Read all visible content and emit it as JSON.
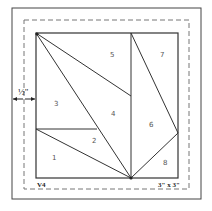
{
  "diagram": {
    "seam_allowance_label": "½\"",
    "block_code": "V4",
    "block_size": "3\" x 3\"",
    "pieces": [
      {
        "label": "1",
        "x": 52,
        "y": 160
      },
      {
        "label": "2",
        "x": 92,
        "y": 143
      },
      {
        "label": "3",
        "x": 54,
        "y": 104
      },
      {
        "label": "4",
        "x": 111,
        "y": 115
      },
      {
        "label": "5",
        "x": 110,
        "y": 55
      },
      {
        "label": "6",
        "x": 150,
        "y": 125
      },
      {
        "label": "7",
        "x": 160,
        "y": 55
      },
      {
        "label": "8",
        "x": 163,
        "y": 163
      }
    ],
    "colors": {
      "line": "#333333",
      "dash": "#666666",
      "frame": "#444444"
    }
  }
}
